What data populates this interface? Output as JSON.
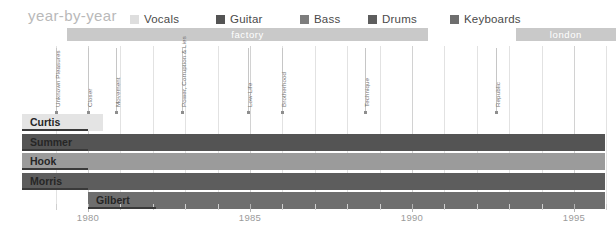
{
  "header": {
    "title": "year-by-year",
    "legend": [
      {
        "label": "Vocals",
        "color": "#dedede",
        "x": 0
      },
      {
        "label": "Guitar",
        "color": "#545454",
        "x": 86
      },
      {
        "label": "Bass",
        "color": "#7d7d7d",
        "x": 170
      },
      {
        "label": "Drums",
        "color": "#5d5d5d",
        "x": 238
      },
      {
        "label": "Keyboards",
        "color": "#6e6e6e",
        "x": 320
      }
    ]
  },
  "labels": {
    "bands": [
      {
        "name": "factory",
        "start_year": 1979.35,
        "end_year": 1990.5,
        "color": "#c9c9c9"
      },
      {
        "name": "london",
        "start_year": 1993.2,
        "end_year": 1996.3,
        "color": "#c9c9c9"
      }
    ]
  },
  "chart_data": {
    "type": "bar",
    "title": "year-by-year",
    "xlabel": "",
    "ylabel": "",
    "xlim": [
      1978.5,
      1996.5
    ],
    "grid": true,
    "legend_position": "top",
    "xticks": [
      1979,
      1980,
      1981,
      1982,
      1983,
      1984,
      1985,
      1986,
      1987,
      1988,
      1989,
      1990,
      1991,
      1992,
      1993,
      1994,
      1995,
      1996
    ],
    "xtick_labels": [
      "",
      "1980",
      "",
      "",
      "",
      "",
      "1985",
      "",
      "",
      "",
      "",
      "1990",
      "",
      "",
      "",
      "",
      "1995",
      ""
    ],
    "major_ticks": [
      1980,
      1985,
      1990,
      1995
    ],
    "members": [
      {
        "name": "Curtis",
        "start_year": 1978.9,
        "end_year": 1980.45,
        "color": "#e4e4e4",
        "role": "Vocals",
        "label_inside": true
      },
      {
        "name": "Summer",
        "start_year": 1978.9,
        "end_year": 1995.95,
        "color": "#545454",
        "role": "Guitar",
        "label_inside": true
      },
      {
        "name": "Hook",
        "start_year": 1978.9,
        "end_year": 1995.95,
        "color": "#9b9b9b",
        "role": "Bass",
        "label_inside": true
      },
      {
        "name": "Morris",
        "start_year": 1978.9,
        "end_year": 1995.95,
        "color": "#5d5d5d",
        "role": "Drums",
        "label_inside": true
      },
      {
        "name": "Gilbert",
        "start_year": 1980.0,
        "end_year": 1995.95,
        "color": "#6e6e6e",
        "role": "Keyboards",
        "label_inside": true
      }
    ],
    "albums": [
      {
        "name": "Unknown Pleasures",
        "year": 1979.0
      },
      {
        "name": "Closer",
        "year": 1980.0
      },
      {
        "name": "Movement",
        "year": 1980.85
      },
      {
        "name": "Power, Corruption & Lies",
        "year": 1982.9
      },
      {
        "name": "Low-Life",
        "year": 1984.95
      },
      {
        "name": "Brotherhood",
        "year": 1986.0
      },
      {
        "name": "Technique",
        "year": 1988.55
      },
      {
        "name": "Republic",
        "year": 1992.6
      }
    ]
  }
}
